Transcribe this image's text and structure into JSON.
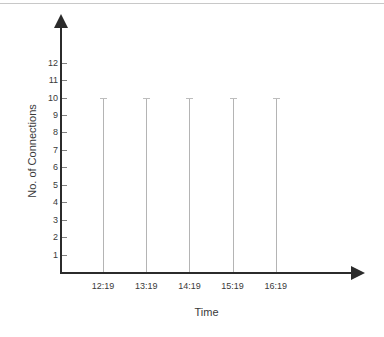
{
  "chart_data": {
    "type": "bar",
    "title": "",
    "xlabel": "Time",
    "ylabel": "No. of Connections",
    "categories": [
      "12:19",
      "13:19",
      "14:19",
      "15:19",
      "16:19"
    ],
    "values": [
      10,
      10,
      10,
      10,
      10
    ],
    "series": [
      {
        "name": "No. of Connections",
        "values": [
          10,
          10,
          10,
          10,
          10
        ]
      }
    ],
    "ylim": [
      0,
      12
    ],
    "yticks": [
      1,
      2,
      3,
      4,
      5,
      6,
      7,
      8,
      9,
      10,
      11,
      12
    ],
    "ytick_labels": [
      "1",
      "2",
      "3",
      "4",
      "5",
      "6",
      "7",
      "8",
      "9",
      "10",
      "11",
      "12"
    ],
    "xtick_labels": [
      "12:19",
      "13:19",
      "14:19",
      "15:19",
      "16:19"
    ],
    "grid": false,
    "legend": null,
    "legend_position": "none",
    "annotations": [],
    "style": {
      "bar_color": "#b4b4b4",
      "bar_cap_color": "#bdbdbd",
      "axis_color": "#2b2b2b",
      "tick_color": "#808080",
      "text_color": "#3a3a3a",
      "background": "#ffffff",
      "top_rule_color": "#c8c8c8"
    }
  }
}
